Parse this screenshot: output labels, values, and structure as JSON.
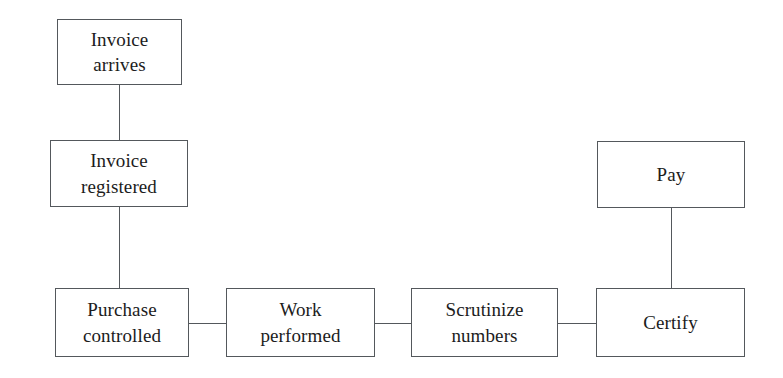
{
  "diagram": {
    "type": "flowchart",
    "title": "",
    "background_color": "#ffffff",
    "border_color": "#54585c",
    "text_color": "#1c1c1c",
    "nodes": [
      {
        "id": "invoice-arrives",
        "label": "Invoice\narrives",
        "x": 57,
        "y": 19,
        "w": 125,
        "h": 66
      },
      {
        "id": "invoice-registered",
        "label": "Invoice\nregistered",
        "x": 50,
        "y": 140,
        "w": 138,
        "h": 67
      },
      {
        "id": "purchase-controlled",
        "label": "Purchase\ncontrolled",
        "x": 55,
        "y": 288,
        "w": 134,
        "h": 69
      },
      {
        "id": "work-performed",
        "label": "Work\nperformed",
        "x": 226,
        "y": 288,
        "w": 149,
        "h": 69
      },
      {
        "id": "scrutinize-numbers",
        "label": "Scrutinize\nnumbers",
        "x": 411,
        "y": 288,
        "w": 147,
        "h": 69
      },
      {
        "id": "certify",
        "label": "Certify",
        "x": 596,
        "y": 288,
        "w": 149,
        "h": 69
      },
      {
        "id": "pay",
        "label": "Pay",
        "x": 597,
        "y": 141,
        "w": 148,
        "h": 67
      }
    ],
    "edges": [
      {
        "id": "invoice-arrives-to-invoice-registered",
        "from": "invoice-arrives",
        "to": "invoice-registered",
        "orientation": "vertical",
        "x": 119,
        "y": 85,
        "length": 55
      },
      {
        "id": "invoice-registered-to-purchase-controlled",
        "from": "invoice-registered",
        "to": "purchase-controlled",
        "orientation": "vertical",
        "x": 119,
        "y": 207,
        "length": 81
      },
      {
        "id": "purchase-controlled-to-work-performed",
        "from": "purchase-controlled",
        "to": "work-performed",
        "orientation": "horizontal",
        "x": 189,
        "y": 323,
        "length": 37
      },
      {
        "id": "work-performed-to-scrutinize-numbers",
        "from": "work-performed",
        "to": "scrutinize-numbers",
        "orientation": "horizontal",
        "x": 375,
        "y": 323,
        "length": 36
      },
      {
        "id": "scrutinize-numbers-to-certify",
        "from": "scrutinize-numbers",
        "to": "certify",
        "orientation": "horizontal",
        "x": 558,
        "y": 323,
        "length": 38
      },
      {
        "id": "certify-to-pay",
        "from": "certify",
        "to": "pay",
        "orientation": "vertical",
        "x": 671,
        "y": 208,
        "length": 80
      }
    ]
  }
}
